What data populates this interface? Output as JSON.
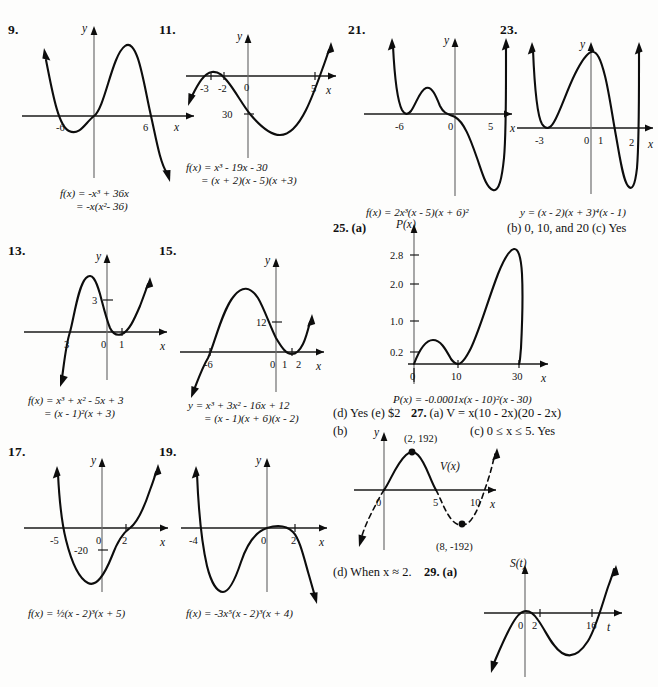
{
  "page": {
    "kind": "textbook-answer-key",
    "problems": [
      {
        "id": "9",
        "number": "9.",
        "axis_x": "x",
        "axis_y": "y",
        "xticks": [
          "-6",
          "6"
        ],
        "caption_line1": "f(x) = -x³ + 36x",
        "caption_line2": "= -x(x²- 36)"
      },
      {
        "id": "11",
        "number": "11.",
        "axis_x": "x",
        "axis_y": "y",
        "xticks": [
          "-3",
          "-2",
          "0",
          "5"
        ],
        "yticks": [
          "30"
        ],
        "caption_line1": "f(x) = x³ - 19x - 30",
        "caption_line2": "= (x + 2)(x - 5)(x +3)"
      },
      {
        "id": "21",
        "number": "21.",
        "axis_x": "x",
        "axis_y": "y",
        "xticks": [
          "-6",
          "0",
          "5"
        ],
        "caption_line1": "f(x) = 2x³(x - 5)(x + 6)²"
      },
      {
        "id": "23",
        "number": "23.",
        "axis_x": "x",
        "axis_y": "y",
        "xticks": [
          "-3",
          "0",
          "1",
          "2"
        ],
        "caption_line1": "y = (x - 2)(x + 3)⁴(x - 1)"
      },
      {
        "id": "13",
        "number": "13.",
        "axis_x": "x",
        "axis_y": "y",
        "xticks": [
          "3",
          "0",
          "1"
        ],
        "yticks": [
          "3"
        ],
        "caption_line1": "f(x) = x³ + x² - 5x + 3",
        "caption_line2": "= (x - 1)²(x + 3)"
      },
      {
        "id": "15",
        "number": "15.",
        "axis_x": "x",
        "axis_y": "y",
        "xticks": [
          "-6",
          "0",
          "1",
          "2"
        ],
        "yticks": [
          "12"
        ],
        "caption_line1": "y = x³ + 3x² - 16x + 12",
        "caption_line2": "= (x - 1)(x + 6)(x - 2)"
      },
      {
        "id": "17",
        "number": "17.",
        "axis_x": "x",
        "axis_y": "y",
        "xticks": [
          "-5",
          "0",
          "2"
        ],
        "yticks": [
          "-20"
        ],
        "caption_line1": "f(x) = ½(x - 2)³(x + 5)"
      },
      {
        "id": "19",
        "number": "19.",
        "axis_x": "x",
        "axis_y": "y",
        "xticks": [
          "-4",
          "0",
          "2"
        ],
        "caption_line1": "f(x) = -3x⁵(x - 2)³(x + 4)"
      }
    ],
    "problem25": {
      "number": "25.",
      "part_a_label": "(a)",
      "axis_y": "P(x)",
      "axis_x": "x",
      "yticks": [
        "2.8",
        "2.0",
        "1.0",
        "0.2"
      ],
      "xticks": [
        "0",
        "10",
        "30"
      ],
      "caption": "P(x) = -0.0001x(x - 10)²(x - 30)",
      "part_b": "(b)  0, 10, and 20  (c)  Yes",
      "part_d_e": "(d)  Yes  (e)  $2"
    },
    "problem27": {
      "number": "27.",
      "part_a": "(a)  V = x(10 - 2x)(20 - 2x)",
      "part_c": "(c)  0 ≤ x ≤ 5. Yes",
      "part_b_label": "(b)",
      "axis_y": "y",
      "axis_x": "x",
      "curve_label": "V(x)",
      "point_max": "(2, 192)",
      "point_min": "(8, -192)",
      "xticks": [
        "0",
        "5",
        "10"
      ],
      "part_d": "(d)  When x ≈ 2."
    },
    "problem29": {
      "number": "29.",
      "part_a_label": "(a)",
      "axis_y": "S(t)",
      "axis_x": "t",
      "xticks": [
        "0",
        "2",
        "16"
      ]
    }
  }
}
